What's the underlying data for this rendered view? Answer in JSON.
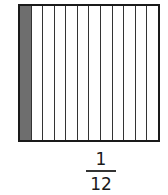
{
  "diagram": {
    "type": "fraction-area-model",
    "total_parts": 12,
    "shaded_parts": 1,
    "shaded_color": "#6e6e6e",
    "border_color": "#1a1a1a"
  },
  "fraction": {
    "numerator": "1",
    "denominator": "12"
  }
}
